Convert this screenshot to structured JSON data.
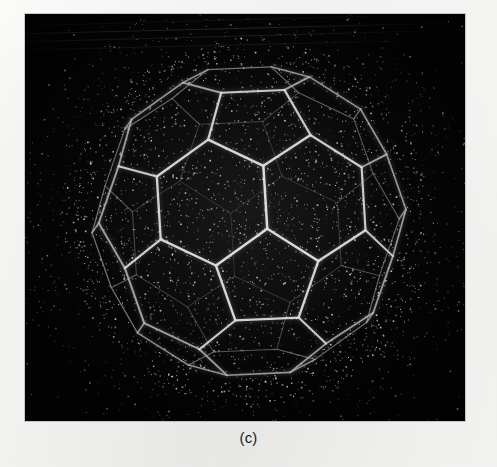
{
  "figure": {
    "caption": "(c)",
    "panel": {
      "background_color": "#050505",
      "x": 25,
      "y": 14,
      "width": 440,
      "height": 407
    },
    "page_background_color": "#f4f4f3",
    "wire_color": "#c9c9c9",
    "wire_color_dim": "#8d8d8d",
    "noise_color": "#9a9a9a",
    "render_style": "white-wireframe-on-black-with-halftone-noise",
    "artifacts": [
      "diagonal-scan-streaks-top-left",
      "halftone-speckle-noise"
    ]
  },
  "chart_data": {
    "type": "scatter",
    "title": "(c)",
    "xlabel": "",
    "ylabel": "",
    "projection": "orthographic-wireframe",
    "solid": "truncated icosahedron (C60 / buckyball)",
    "face_counts": {
      "hexagons": 20,
      "pentagons": 12,
      "vertices": 60,
      "edges": 90
    },
    "visible_faces": 17,
    "silhouette_vertices": [
      [
        233,
        53
      ],
      [
        288,
        60
      ],
      [
        330,
        97
      ],
      [
        366,
        140
      ],
      [
        366,
        191
      ],
      [
        352,
        247
      ],
      [
        320,
        300
      ],
      [
        286,
        342
      ],
      [
        247,
        357
      ],
      [
        191,
        357
      ],
      [
        152,
        330
      ],
      [
        112,
        288
      ],
      [
        88,
        233
      ],
      [
        94,
        176
      ],
      [
        125,
        117
      ],
      [
        170,
        72
      ]
    ],
    "axis_ranges": {
      "x": [
        0,
        440
      ],
      "y": [
        0,
        407
      ]
    },
    "grid": false,
    "legend": false
  }
}
